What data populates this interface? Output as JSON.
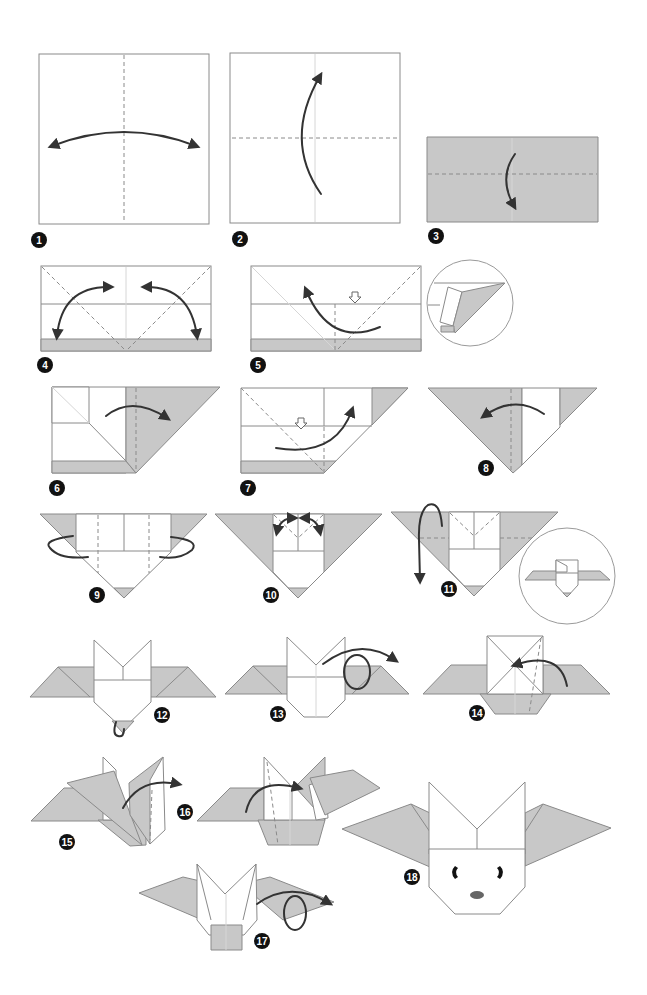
{
  "diagram": {
    "colors": {
      "paper_front": "#ffffff",
      "paper_back": "#c8c8c8",
      "crease_line": "#8a8a8a",
      "arrow": "#333333",
      "badge": "#111111",
      "nose": "#666666"
    },
    "steps": [
      {
        "number": "1",
        "label": "1",
        "action": "Fold in half left-right and unfold"
      },
      {
        "number": "2",
        "label": "2",
        "action": "Fold bottom up to top along horizontal crease"
      },
      {
        "number": "3",
        "label": "3",
        "action": "Fold top layer down along dashed line"
      },
      {
        "number": "4",
        "label": "4",
        "action": "Crease diagonal folds on both sides and unfold"
      },
      {
        "number": "5",
        "label": "5",
        "action": "Squash fold left side (detail view shown)"
      },
      {
        "number": "6",
        "label": "6",
        "action": "Fold flap to the right"
      },
      {
        "number": "7",
        "label": "7",
        "action": "Squash fold right side"
      },
      {
        "number": "8",
        "label": "8",
        "action": "Fold flap back to the left"
      },
      {
        "number": "9",
        "label": "9",
        "action": "Fold sides behind along dashed lines"
      },
      {
        "number": "10",
        "label": "10",
        "action": "Fold top corners outward to form ears"
      },
      {
        "number": "11",
        "label": "11",
        "action": "Fold wings down (result shown in detail circle)"
      },
      {
        "number": "12",
        "label": "12",
        "action": "Fold bottom tip behind"
      },
      {
        "number": "13",
        "label": "13",
        "action": "Turn over"
      },
      {
        "number": "14",
        "label": "14",
        "action": "Fold along diagonal"
      },
      {
        "number": "15",
        "label": "15",
        "action": "Fold wing to the right"
      },
      {
        "number": "16",
        "label": "16",
        "action": "Repeat on other side"
      },
      {
        "number": "17",
        "label": "17",
        "action": "Turn over"
      },
      {
        "number": "18",
        "label": "18",
        "action": "Finished bat with face drawn"
      }
    ],
    "detail_circles": [
      {
        "after_step": "5",
        "description": "Squash fold detail"
      },
      {
        "after_step": "11",
        "description": "Result preview of folded wings"
      }
    ]
  }
}
